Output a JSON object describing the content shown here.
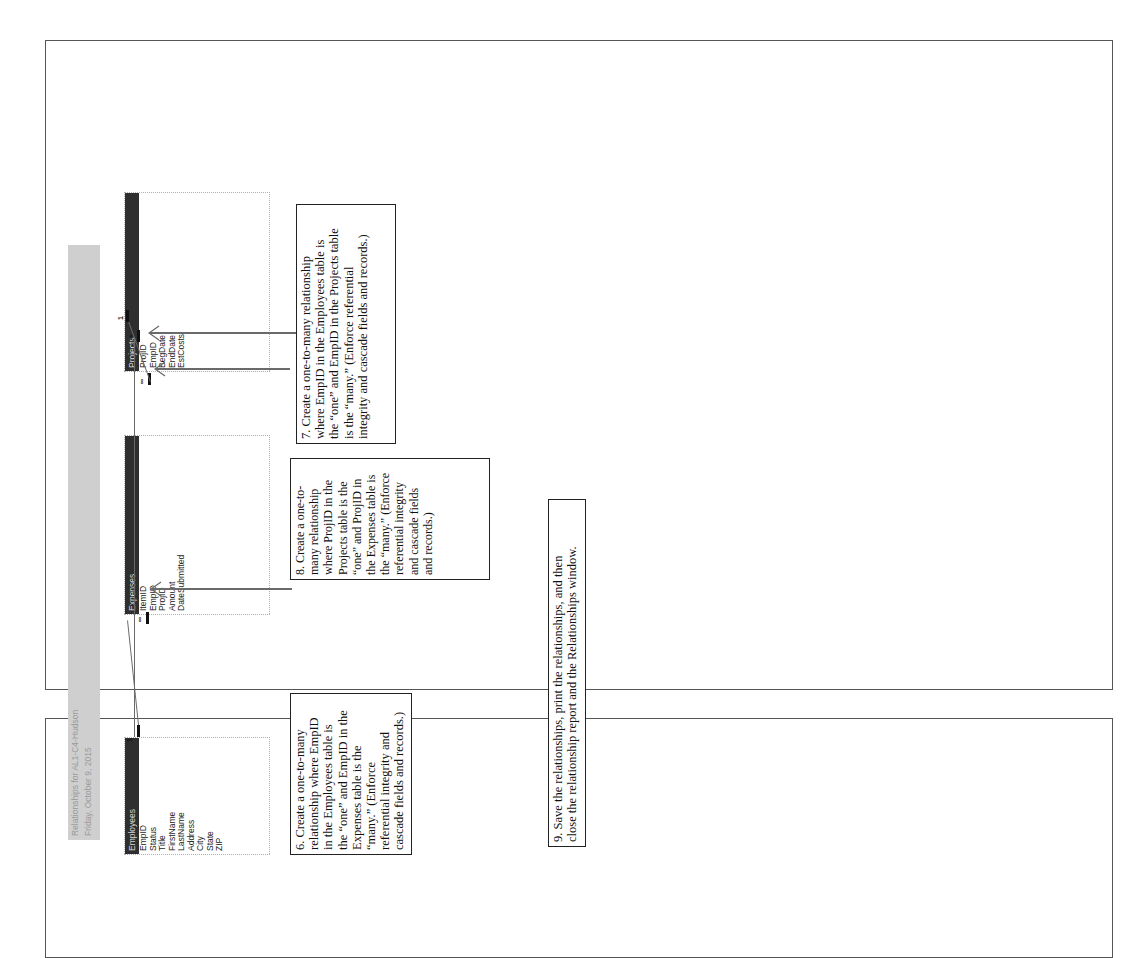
{
  "report": {
    "title": "Relationships for AL1-C4-Hudson",
    "date": "Friday, October 9, 2015"
  },
  "tables": {
    "employees": {
      "name": "Employees",
      "fields": [
        "EmpID",
        "Status",
        "Title",
        "FirstName",
        "LastName",
        "Address",
        "City",
        "State",
        "ZIP"
      ]
    },
    "expenses": {
      "name": "Expenses",
      "fields": [
        "ItemID",
        "EmpID",
        "ProjID",
        "Amount",
        "DateSubmitted"
      ]
    },
    "projects": {
      "name": "Projects",
      "fields": [
        "ProjID",
        "EmpID",
        "BegDate",
        "EndDate",
        "EstCosts"
      ]
    }
  },
  "relationships": [
    {
      "from": "Employees.EmpID",
      "to": "Expenses.EmpID",
      "one_symbol": "1",
      "many_symbol": "∞"
    },
    {
      "from": "Employees.EmpID",
      "to": "Projects.EmpID",
      "one_symbol": "1",
      "many_symbol": "∞"
    },
    {
      "from": "Projects.ProjID",
      "to": "Expenses.ProjID",
      "one_symbol": "1",
      "many_symbol": "∞"
    }
  ],
  "notes": {
    "step6": {
      "lines": [
        "6. Create a one-to-many",
        "relationship where EmpID",
        "in the Employees table is",
        "the “one” and EmpID in the",
        "Expenses table is the",
        "“many.” (Enforce",
        "referential integrity and",
        "cascade fields and records.)"
      ]
    },
    "step7": {
      "lines": [
        "7. Create a one-to-many relationship",
        "where EmpID in the Employees table is",
        "the “one” and EmpID in the Projects table",
        "is the “many.” (Enforce referential",
        "integrity and cascade fields and records.)"
      ]
    },
    "step8": {
      "lines": [
        "8. Create a one-to-",
        "many relationship",
        "where ProjID in the",
        "Projects table is the",
        "“one” and ProjID in",
        "the Expenses table is",
        "the “many.” (Enforce",
        "referential integrity",
        "and cascade fields",
        "and records.)"
      ]
    },
    "step9": {
      "lines": [
        "9. Save the relationships, print the relationships, and then",
        "close the relationship report and the Relationships window."
      ]
    }
  },
  "colors": {
    "table_header": "#2f2f2f",
    "header_band": "#cfcfcf",
    "frame_border": "#555555"
  }
}
